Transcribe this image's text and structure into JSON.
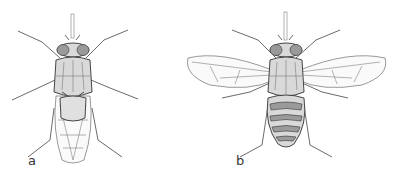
{
  "figure": {
    "panels": [
      {
        "label": "a",
        "description": "tsetse fly, dorsal view, wings folded"
      },
      {
        "label": "b",
        "description": "tsetse fly, dorsal view, wings spread"
      }
    ],
    "colors": {
      "line": "#444444",
      "background": "#ffffff"
    }
  }
}
